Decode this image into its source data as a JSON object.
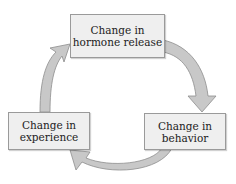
{
  "diagram": {
    "type": "cycle",
    "nodes": [
      {
        "id": "hormone",
        "line1": "Change in",
        "line2": "hormone release"
      },
      {
        "id": "behavior",
        "line1": "Change in",
        "line2": "behavior"
      },
      {
        "id": "experience",
        "line1": "Change in",
        "line2": "experience"
      }
    ],
    "edges": [
      {
        "from": "hormone",
        "to": "behavior"
      },
      {
        "from": "behavior",
        "to": "experience"
      },
      {
        "from": "experience",
        "to": "hormone"
      }
    ],
    "colors": {
      "box_fill": "#efefef",
      "box_border": "#9a9a9a",
      "arrow_fill": "#c8c8c8",
      "arrow_stroke": "#8e8e8e",
      "text": "#222222"
    }
  }
}
